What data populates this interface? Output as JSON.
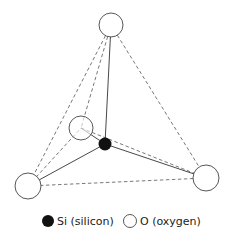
{
  "diagram": {
    "colors": {
      "line": "#333333",
      "dash": "#555555",
      "silicon": "#111111",
      "oxygen_fill": "#ffffff",
      "oxygen_stroke": "#444444"
    },
    "atoms": [
      {
        "id": "o-top",
        "type": "O",
        "cx": 111,
        "cy": 25,
        "r": 12
      },
      {
        "id": "o-back",
        "type": "O",
        "cx": 81,
        "cy": 128,
        "r": 12
      },
      {
        "id": "o-left",
        "type": "O",
        "cx": 28,
        "cy": 186,
        "r": 13
      },
      {
        "id": "o-right",
        "type": "O",
        "cx": 206,
        "cy": 178,
        "r": 13
      },
      {
        "id": "si-center",
        "type": "Si",
        "cx": 105,
        "cy": 144,
        "r": 6.5
      }
    ],
    "bonds": [
      {
        "from": "si-center",
        "to": "o-top",
        "style": "solid"
      },
      {
        "from": "si-center",
        "to": "o-left",
        "style": "solid"
      },
      {
        "from": "si-center",
        "to": "o-right",
        "style": "solid"
      },
      {
        "from": "si-center",
        "to": "o-back",
        "style": "solid"
      }
    ],
    "edges": [
      {
        "from": "o-top",
        "to": "o-left",
        "style": "dashed"
      },
      {
        "from": "o-top",
        "to": "o-right",
        "style": "dashed"
      },
      {
        "from": "o-top",
        "to": "o-back",
        "style": "dashed"
      },
      {
        "from": "o-left",
        "to": "o-right",
        "style": "dashed"
      },
      {
        "from": "o-left",
        "to": "o-back",
        "style": "dashed"
      },
      {
        "from": "o-back",
        "to": "o-right",
        "style": "dashed"
      }
    ]
  },
  "legend": {
    "silicon_label": "Si (silicon)",
    "oxygen_label": "O (oxygen)"
  }
}
